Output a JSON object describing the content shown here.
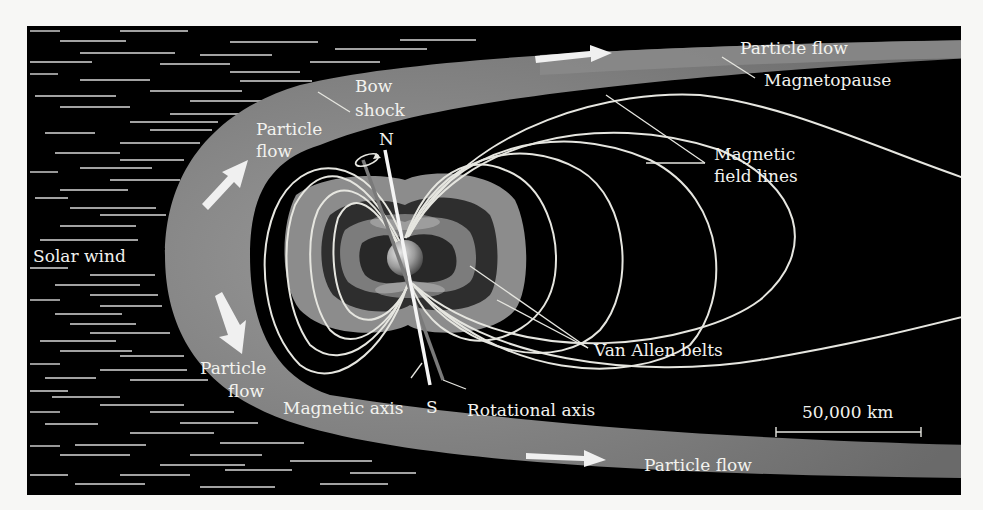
{
  "figure": {
    "colors": {
      "background": "#000000",
      "page": "#f7f7f5",
      "sheath": "#7a7a7a",
      "field_line": "#e6e6e0",
      "belt_outer": "#8c8c8c",
      "belt_inner": "#2e2e2e",
      "label": "#f2f2ee"
    },
    "labels": {
      "solar_wind": "Solar wind",
      "bow_shock_line1": "Bow",
      "bow_shock_line2": "shock",
      "particle_flow_upper_left_line1": "Particle",
      "particle_flow_upper_left_line2": "flow",
      "particle_flow_lower_left_line1": "Particle",
      "particle_flow_lower_left_line2": "flow",
      "particle_flow_top": "Particle flow",
      "particle_flow_bottom": "Particle flow",
      "magnetopause": "Magnetopause",
      "magnetic_field_lines_line1": "Magnetic",
      "magnetic_field_lines_line2": "field lines",
      "van_allen_belts": "Van Allen belts",
      "magnetic_axis": "Magnetic axis",
      "rotational_axis": "Rotational axis",
      "north_pole": "N",
      "south_pole": "S",
      "scale_bar": "50,000 km"
    },
    "icons": {
      "flow_arrow": "arrow-icon",
      "rotation_indicator": "rotation-arrow-icon"
    }
  }
}
